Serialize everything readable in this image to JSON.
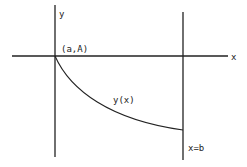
{
  "diagram": {
    "type": "function-graph-sketch",
    "colors": {
      "background": "#ffffff",
      "line": "#222222",
      "text": "#222222"
    },
    "axes": {
      "x_label": "x",
      "y_label": "y"
    },
    "labels": {
      "start_point": "(a,A)",
      "curve": "y(x)",
      "end_line": "x=b"
    },
    "geometry": {
      "x_axis": {
        "x1": 12,
        "y1": 56,
        "x2": 228,
        "y2": 56
      },
      "left_vertical": {
        "x1": 55,
        "y1": 5,
        "x2": 55,
        "y2": 157
      },
      "right_vertical": {
        "x1": 183,
        "y1": 12,
        "x2": 183,
        "y2": 160
      },
      "curve_path": "M55,56 C70,90 110,120 183,130"
    }
  }
}
